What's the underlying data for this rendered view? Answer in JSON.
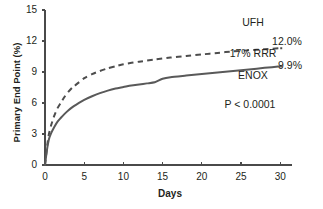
{
  "chart_data": {
    "type": "line",
    "title": "",
    "xlabel": "Days",
    "ylabel": "Primary End Point (%)",
    "xlim": [
      0,
      31.5
    ],
    "ylim": [
      0,
      15
    ],
    "xticks": [
      0,
      5,
      10,
      15,
      20,
      25,
      30
    ],
    "xtick_labels": [
      "0",
      "5",
      "10",
      "15",
      "20",
      "25",
      "30"
    ],
    "yticks": [
      0,
      3,
      6,
      9,
      12,
      15
    ],
    "ytick_labels": [
      "0",
      "3",
      "6",
      "9",
      "12",
      "15"
    ],
    "grid": false,
    "legend_position": "inline-annotations",
    "series": [
      {
        "name": "UFH",
        "style": "dashed",
        "color": "#4d4d4d",
        "end_label": "12.0%",
        "x": [
          0,
          0.15,
          0.3,
          0.5,
          0.8,
          1.2,
          1.6,
          2.0,
          2.5,
          3.0,
          3.5,
          4.0,
          5.0,
          6.0,
          7.0,
          8.0,
          9.0,
          10.0,
          12.0,
          14.0,
          16.0,
          18.0,
          20.0,
          22.0,
          24.0,
          26.0,
          28.0,
          30.0
        ],
        "y": [
          0.0,
          1.0,
          2.0,
          3.0,
          3.9,
          4.8,
          5.5,
          6.0,
          6.6,
          7.1,
          7.5,
          7.8,
          8.4,
          8.8,
          9.1,
          9.35,
          9.55,
          9.75,
          10.0,
          10.2,
          10.4,
          10.55,
          10.7,
          10.85,
          11.0,
          11.1,
          11.2,
          11.3
        ]
      },
      {
        "name": "ENOX",
        "style": "solid",
        "color": "#595959",
        "end_label": "9.9%",
        "x": [
          0,
          0.15,
          0.3,
          0.5,
          0.8,
          1.2,
          1.6,
          2.0,
          2.5,
          3.0,
          3.5,
          4.0,
          5.0,
          6.0,
          7.0,
          8.0,
          9.0,
          10.0,
          11.0,
          12.0,
          13.0,
          14.0,
          15.0,
          16.0,
          18.0,
          20.0,
          22.0,
          24.0,
          26.0,
          28.0,
          30.0
        ],
        "y": [
          0.0,
          0.9,
          1.7,
          2.5,
          3.1,
          3.7,
          4.2,
          4.55,
          4.95,
          5.3,
          5.6,
          5.85,
          6.3,
          6.65,
          6.95,
          7.2,
          7.4,
          7.55,
          7.7,
          7.8,
          7.9,
          8.0,
          8.35,
          8.5,
          8.65,
          8.8,
          8.95,
          9.1,
          9.25,
          9.4,
          9.55
        ]
      }
    ],
    "annotations": [
      {
        "id": "ufh-label",
        "text": "UFH",
        "x_px": 253,
        "y_px": 22
      },
      {
        "id": "ufh-value",
        "text": "12.0%",
        "x_px": 287,
        "y_px": 41
      },
      {
        "id": "rrr-label",
        "text": "17% RRR",
        "x_px": 253,
        "y_px": 53
      },
      {
        "id": "enox-value",
        "text": "9.9%",
        "x_px": 290,
        "y_px": 65
      },
      {
        "id": "enox-label",
        "text": "ENOX",
        "x_px": 253,
        "y_px": 75
      },
      {
        "id": "p-value",
        "text": "P < 0.0001",
        "x_px": 250,
        "y_px": 104
      }
    ]
  },
  "axes": {
    "plot_left_px": 45,
    "plot_right_px": 292,
    "plot_top_px": 10,
    "plot_bottom_px": 165
  }
}
